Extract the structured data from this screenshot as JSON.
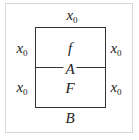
{
  "diagram": {
    "labels": {
      "top": {
        "var": "x",
        "sub": "0"
      },
      "left_upper": {
        "var": "x",
        "sub": "0"
      },
      "left_lower": {
        "var": "x",
        "sub": "0"
      },
      "right_upper": {
        "var": "x",
        "sub": "0"
      },
      "right_lower": {
        "var": "x",
        "sub": "0"
      },
      "upper_region": "f",
      "divider": "A",
      "lower_region": "F",
      "bottom": "B"
    }
  }
}
